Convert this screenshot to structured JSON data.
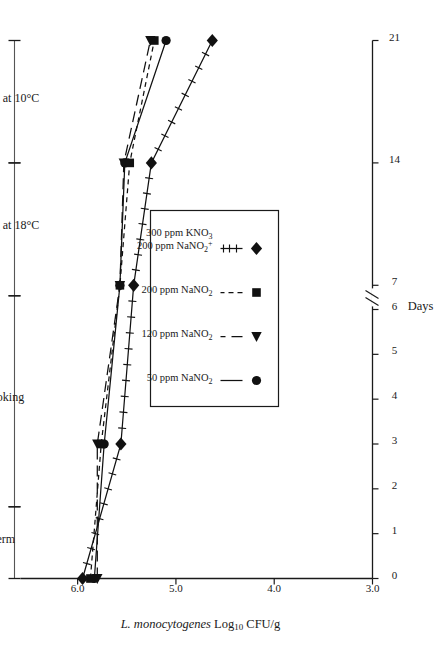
{
  "figure": {
    "y_axis_title": "L. monocytogenes  Log10 CFU/g",
    "y_axis_title_italic_part": "L. monocytogenes",
    "y_axis_title_rest": "Log",
    "y_axis_title_sub": "10",
    "y_axis_title_tail": "CFU/g",
    "x_axis_title": "Days",
    "axis_break_symbol": "//"
  },
  "phases": [
    {
      "label": "Ferm",
      "start_day": 0,
      "end_day": 1.6
    },
    {
      "label": "Smoking",
      "start_day": 1.6,
      "end_day": 6.4
    },
    {
      "label": "Drying at 18°C",
      "start_day": 6.4,
      "end_day": 14
    },
    {
      "label": "Drying at 10°C",
      "start_day": 14,
      "end_day": 21
    }
  ],
  "legend": {
    "entries": [
      {
        "label": "50 ppm  NaNO",
        "sub": "2",
        "sup": "",
        "label2": "",
        "sub2": "",
        "marker": "circle",
        "line": "solid"
      },
      {
        "label": "120 ppm NaNO",
        "sub": "2",
        "sup": "",
        "label2": "",
        "sub2": "",
        "marker": "triangle",
        "line": "long-dash"
      },
      {
        "label": "200 ppm NaNO",
        "sub": "2",
        "sup": "",
        "label2": "",
        "sub2": "",
        "marker": "square",
        "line": "short-dash"
      },
      {
        "label": "200 ppm NaNO",
        "sub": "2",
        "sup": "+",
        "label2": "300 ppm KNO",
        "sub2": "3",
        "marker": "diamond",
        "line": "ticked"
      }
    ]
  },
  "chart_data": {
    "type": "line",
    "title": "",
    "xlabel": "Days",
    "ylabel": "L. monocytogenes Log10 CFU/g",
    "xlim": [
      0,
      21
    ],
    "ylim": [
      3.0,
      6.5
    ],
    "grid": false,
    "legend_position": "inside-center",
    "x_ticks": [
      0,
      1,
      2,
      3,
      4,
      5,
      6,
      7,
      14,
      21
    ],
    "x_tick_labels": [
      "0",
      "1",
      "2",
      "3",
      "4",
      "5",
      "6",
      "7",
      "14",
      "21"
    ],
    "axis_break_between": [
      6,
      7
    ],
    "y_ticks": [
      3.0,
      4.0,
      5.0,
      6.0
    ],
    "y_tick_labels": [
      "3.0",
      "4.0",
      "5.0",
      "6.0"
    ],
    "series": [
      {
        "name": "50 ppm NaNO2",
        "marker": "circle",
        "line": "solid",
        "x": [
          0,
          3,
          7,
          14,
          21
        ],
        "values": [
          5.83,
          5.73,
          5.57,
          5.52,
          5.1
        ]
      },
      {
        "name": "120 ppm NaNO2",
        "marker": "triangle",
        "line": "long-dash",
        "x": [
          0,
          3,
          7,
          14,
          21
        ],
        "values": [
          5.8,
          5.8,
          5.57,
          5.53,
          5.26
        ]
      },
      {
        "name": "200 ppm NaNO2",
        "marker": "square",
        "line": "short-dash",
        "x": [
          0,
          3,
          7,
          14,
          21
        ],
        "values": [
          5.87,
          5.76,
          5.57,
          5.47,
          5.22
        ]
      },
      {
        "name": "200 ppm NaNO2 + 300 ppm KNO3",
        "marker": "diamond",
        "line": "ticked",
        "x": [
          0,
          3,
          7,
          14,
          21
        ],
        "values": [
          5.95,
          5.56,
          5.43,
          5.25,
          4.63
        ]
      }
    ]
  }
}
